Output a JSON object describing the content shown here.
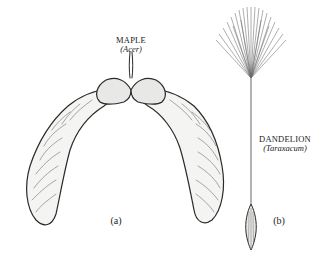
{
  "figure": {
    "panels": [
      {
        "id": "a",
        "panel_label": "(a)",
        "common_name": "MAPLE",
        "scientific_name": "(Acer)",
        "subject": "maple samara (double-winged seed)"
      },
      {
        "id": "b",
        "panel_label": "(b)",
        "common_name": "DANDELION",
        "scientific_name": "(Taraxacum)",
        "subject": "dandelion seed with pappus"
      }
    ],
    "colors": {
      "background": "#ffffff",
      "ink": "#222222",
      "wing_fill": "#f4f4f2",
      "seed_fill": "#e8e8e6"
    }
  }
}
